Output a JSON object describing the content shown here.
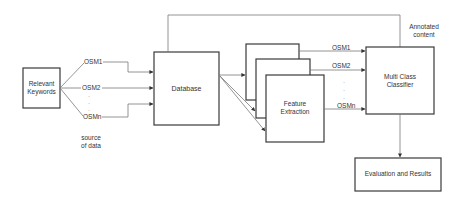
{
  "diagram": {
    "nodes": {
      "keywords": "Relevant Keywords",
      "database": "Database",
      "feature_extraction": "Feature Extraction",
      "classifier": "Multi Class Classifier",
      "evaluation": "Evaluation and Results"
    },
    "source_labels": [
      "OSM1",
      "OSM2",
      "OSMn"
    ],
    "source_caption": "source of data",
    "feature_labels": [
      "OSM1",
      "OSM2",
      "OSMn"
    ],
    "annotation": "Annotated content",
    "ellipsis": "·"
  }
}
